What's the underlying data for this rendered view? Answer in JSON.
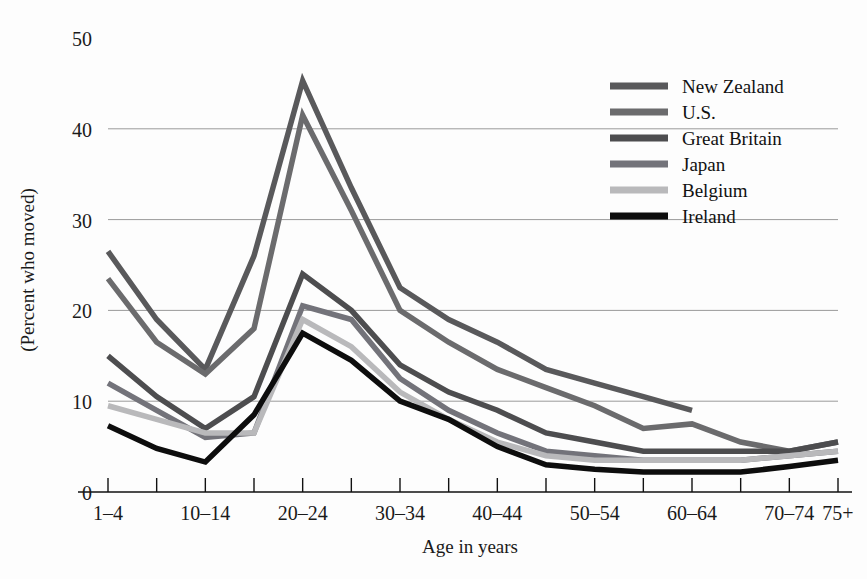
{
  "chart_data": {
    "type": "line",
    "title": "",
    "xlabel": "Age in years",
    "ylabel": "(Percent who moved)",
    "ylim": [
      0,
      50
    ],
    "yticks": [
      0,
      10,
      20,
      30,
      40,
      50
    ],
    "grid": true,
    "legend_position": "top-right",
    "categories": [
      "1–4",
      "5–9",
      "10–14",
      "15–19",
      "20–24",
      "25–29",
      "30–34",
      "35–39",
      "40–44",
      "45–49",
      "50–54",
      "55–59",
      "60–64",
      "65–69",
      "70–74",
      "75+"
    ],
    "tick_labels_shown": [
      "1–4",
      "10–14",
      "20–24",
      "30–34",
      "40–44",
      "50–54",
      "60–64",
      "70–74",
      "75+"
    ],
    "series": [
      {
        "name": "New Zealand",
        "color": "#59595b",
        "values": [
          26.5,
          19.0,
          13.5,
          26.0,
          45.3,
          33.5,
          22.5,
          19.0,
          16.5,
          13.5,
          12.0,
          10.5,
          9.0,
          null,
          null,
          null
        ]
      },
      {
        "name": "U.S.",
        "color": "#6b6b6d",
        "values": [
          23.5,
          16.5,
          13.0,
          18.0,
          41.5,
          31.0,
          20.0,
          16.5,
          13.5,
          11.5,
          9.5,
          7.0,
          7.5,
          5.5,
          4.5,
          5.5
        ]
      },
      {
        "name": "Great Britain",
        "color": "#4d4d4f",
        "values": [
          15.0,
          10.5,
          7.0,
          10.5,
          24.0,
          20.0,
          14.0,
          11.0,
          9.0,
          6.5,
          5.5,
          4.5,
          4.5,
          4.5,
          4.5,
          5.5
        ]
      },
      {
        "name": "Japan",
        "color": "#73737a",
        "values": [
          12.0,
          9.0,
          6.0,
          6.5,
          20.5,
          19.0,
          12.5,
          9.0,
          6.5,
          4.5,
          4.0,
          3.5,
          3.5,
          3.5,
          4.0,
          4.5
        ]
      },
      {
        "name": "Belgium",
        "color": "#b9b9bb",
        "values": [
          9.5,
          8.0,
          6.5,
          6.5,
          19.0,
          16.0,
          11.0,
          8.0,
          5.5,
          4.0,
          3.5,
          3.5,
          3.5,
          3.5,
          4.0,
          4.5
        ]
      },
      {
        "name": "Ireland",
        "color": "#0d0d0d",
        "values": [
          7.3,
          4.8,
          3.3,
          8.5,
          17.5,
          14.5,
          10.0,
          8.0,
          5.0,
          3.0,
          2.5,
          2.2,
          2.2,
          2.2,
          2.8,
          3.5
        ]
      }
    ]
  },
  "axes": {
    "y_tick_text": [
      "50",
      "40",
      "30",
      "20",
      "10",
      "0"
    ],
    "x_tick_text": [
      "1–4",
      "10–14",
      "20–24",
      "30–34",
      "40–44",
      "50–54",
      "60–64",
      "70–74",
      "75+"
    ],
    "x_title": "Age in years",
    "y_title": "(Percent who moved)"
  },
  "legend": {
    "entries": [
      {
        "label": "New Zealand",
        "swatch": "#59595b"
      },
      {
        "label": "U.S.",
        "swatch": "#6b6b6d"
      },
      {
        "label": "Great Britain",
        "swatch": "#4d4d4f"
      },
      {
        "label": "Japan",
        "swatch": "#73737a"
      },
      {
        "label": "Belgium",
        "swatch": "#b9b9bb"
      },
      {
        "label": "Ireland",
        "swatch": "#0d0d0d"
      }
    ]
  }
}
